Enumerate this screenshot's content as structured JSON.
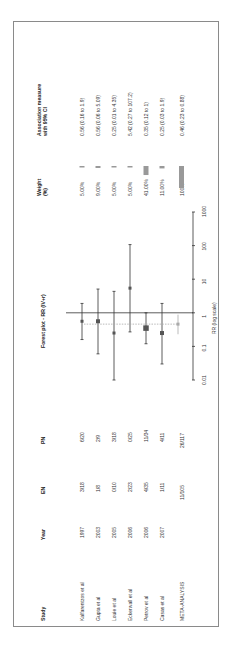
{
  "headers": {
    "study": "Study",
    "year": "Year",
    "en": "EN",
    "pn": "PN",
    "plot_title": "Forest plot - RR (IV+r)",
    "weight_line1": "Weight",
    "weight_line2": "(%)",
    "assoc_line1": "Association measure",
    "assoc_line2": "with 95% CI"
  },
  "rows": [
    {
      "study": "Kalfarentzos et al",
      "year": "1997",
      "en": "3/18",
      "pn": "6/20",
      "weight": "5.00%",
      "assoc": "0.56 (0.16  to  1.9)"
    },
    {
      "study": "Gupta et al",
      "year": "2003",
      "en": "1/8",
      "pn": "2/9",
      "weight": "9.00%",
      "assoc": "0.56 (0.06  to  5.09)"
    },
    {
      "study": "Louie et al",
      "year": "2005",
      "en": "0/10",
      "pn": "3/18",
      "weight": "5.00%",
      "assoc": "0.25 (0.01  to  4.35)"
    },
    {
      "study": "Eckerwall et al",
      "year": "2006",
      "en": "2/23",
      "pn": "0/25",
      "weight": "5.00%",
      "assoc": "5.42 (0.27  to  107.2)"
    },
    {
      "study": "Petrov et al",
      "year": "2006",
      "en": "4/35",
      "pn": "11/34",
      "weight": "41.00%",
      "assoc": "0.35 (0.12  to  1)"
    },
    {
      "study": "Casas et al",
      "year": "2007",
      "en": "1/11",
      "pn": "4/11",
      "weight": "11.00%",
      "assoc": "0.25 (0.03  to  1.9)"
    }
  ],
  "meta": {
    "study": "META-ANALYSIS",
    "en": "11/105",
    "pn": "26/117",
    "weight": "100%",
    "assoc": "0.46 (0.23 to 0.88)"
  },
  "axis": {
    "label": "RR (log scale)",
    "ticks": [
      "0.01",
      "0.1",
      "1",
      "10",
      "100",
      "1000"
    ]
  },
  "chart_data": {
    "type": "forest",
    "title": "Forest plot - RR (IV+r)",
    "xlabel": "RR (log scale)",
    "xscale": "log",
    "xlim": [
      0.01,
      1000
    ],
    "xticks": [
      0.01,
      0.1,
      1,
      10,
      100,
      1000
    ],
    "reference_line": 1,
    "studies": [
      {
        "name": "Kalfarentzos et al",
        "year": 1997,
        "en": "3/18",
        "pn": "6/20",
        "rr": 0.56,
        "ci_low": 0.16,
        "ci_high": 1.9,
        "weight": 5.0
      },
      {
        "name": "Gupta et al",
        "year": 2003,
        "en": "1/8",
        "pn": "2/9",
        "rr": 0.56,
        "ci_low": 0.06,
        "ci_high": 5.09,
        "weight": 9.0
      },
      {
        "name": "Louie et al",
        "year": 2005,
        "en": "0/10",
        "pn": "3/18",
        "rr": 0.25,
        "ci_low": 0.01,
        "ci_high": 4.35,
        "weight": 5.0
      },
      {
        "name": "Eckerwall et al",
        "year": 2006,
        "en": "2/23",
        "pn": "0/25",
        "rr": 5.42,
        "ci_low": 0.27,
        "ci_high": 107.2,
        "weight": 5.0
      },
      {
        "name": "Petrov et al",
        "year": 2006,
        "en": "4/35",
        "pn": "11/34",
        "rr": 0.35,
        "ci_low": 0.12,
        "ci_high": 1.0,
        "weight": 41.0
      },
      {
        "name": "Casas et al",
        "year": 2007,
        "en": "1/11",
        "pn": "4/11",
        "rr": 0.25,
        "ci_low": 0.03,
        "ci_high": 1.9,
        "weight": 11.0
      }
    ],
    "pooled": {
      "name": "META-ANALYSIS",
      "en": "11/105",
      "pn": "26/117",
      "rr": 0.46,
      "ci_low": 0.23,
      "ci_high": 0.88,
      "weight": 100
    }
  },
  "colors": {
    "marker": "#555555",
    "line": "#333333",
    "weight_bar": "#999999",
    "pooled_line": "#aaaaaa",
    "frame": "#8a8a8a"
  }
}
